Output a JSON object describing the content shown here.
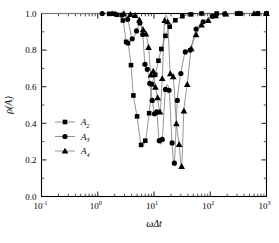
{
  "chart_data": {
    "type": "line",
    "title": "",
    "xlabel": "ωΔt",
    "ylabel": "ρ(A)",
    "xscale": "log",
    "yscale": "linear",
    "xlim": [
      0.1,
      1000
    ],
    "ylim": [
      0.0,
      1.0
    ],
    "grid": false,
    "legend_position": "center-left",
    "x_tick_labels": [
      "10-1",
      "100",
      "101",
      "102",
      "103"
    ],
    "x_tick_values": [
      0.1,
      1,
      10,
      100,
      1000
    ],
    "y_tick_labels": [
      "0.0",
      "0.2",
      "0.4",
      "0.6",
      "0.8",
      "1.0"
    ],
    "y_tick_values": [
      0.0,
      0.2,
      0.4,
      0.6,
      0.8,
      1.0
    ],
    "x_exponents": [
      "-1",
      "0",
      "1",
      "2",
      "3"
    ],
    "x_mantissa": "10",
    "series": [
      {
        "name": "A2",
        "label_base": "A",
        "label_sub": "2",
        "marker": "square",
        "points": [
          [
            0.1,
            1.0
          ],
          [
            0.3,
            1.0
          ],
          [
            0.6,
            1.0
          ],
          [
            1.0,
            1.0
          ],
          [
            1.6,
            0.998
          ],
          [
            2.2,
            0.993
          ],
          [
            2.8,
            0.962
          ],
          [
            3.2,
            0.845
          ],
          [
            3.45,
            0.838
          ],
          [
            3.9,
            0.718
          ],
          [
            4.3,
            0.552
          ],
          [
            5.0,
            0.438
          ],
          [
            5.9,
            0.282
          ],
          [
            7.0,
            0.305
          ],
          [
            8.2,
            0.455
          ],
          [
            9.2,
            0.613
          ],
          [
            10.5,
            0.665
          ],
          [
            12.0,
            0.742
          ],
          [
            13.5,
            0.806
          ],
          [
            16.0,
            0.878
          ],
          [
            19.0,
            0.928
          ],
          [
            24.0,
            0.963
          ],
          [
            32.0,
            0.985
          ],
          [
            45.0,
            0.995
          ],
          [
            70.0,
            1.0
          ],
          [
            130.0,
            1.0
          ],
          [
            300.0,
            1.0
          ],
          [
            700.0,
            1.0
          ],
          [
            1000.0,
            1.0
          ]
        ]
      },
      {
        "name": "A3",
        "label_base": "A",
        "label_sub": "3",
        "marker": "circle",
        "points": [
          [
            0.1,
            1.0
          ],
          [
            0.5,
            1.0
          ],
          [
            1.2,
            1.0
          ],
          [
            2.0,
            0.998
          ],
          [
            2.7,
            0.992
          ],
          [
            3.4,
            0.968
          ],
          [
            4.1,
            0.862
          ],
          [
            4.9,
            0.905
          ],
          [
            5.6,
            0.948
          ],
          [
            6.3,
            0.885
          ],
          [
            6.9,
            0.722
          ],
          [
            7.6,
            0.695
          ],
          [
            8.4,
            0.618
          ],
          [
            9.3,
            0.525
          ],
          [
            10.2,
            0.452
          ],
          [
            11.2,
            0.462
          ],
          [
            12.4,
            0.305
          ],
          [
            14.0,
            0.312
          ],
          [
            16.0,
            0.585
          ],
          [
            18.5,
            0.58
          ],
          [
            21.0,
            0.293
          ],
          [
            23.0,
            0.182
          ],
          [
            26.0,
            0.525
          ],
          [
            30.0,
            0.672
          ],
          [
            36.0,
            0.79
          ],
          [
            44.0,
            0.8
          ],
          [
            56.0,
            0.915
          ],
          [
            75.0,
            0.955
          ],
          [
            110.0,
            0.985
          ],
          [
            180.0,
            0.998
          ],
          [
            350.0,
            1.0
          ],
          [
            700.0,
            1.0
          ],
          [
            1000.0,
            1.0
          ]
        ]
      },
      {
        "name": "A4",
        "label_base": "A",
        "label_sub": "4",
        "marker": "triangle",
        "points": [
          [
            0.1,
            1.0
          ],
          [
            0.8,
            1.0
          ],
          [
            1.8,
            1.0
          ],
          [
            2.9,
            0.999
          ],
          [
            3.8,
            0.995
          ],
          [
            4.6,
            0.99
          ],
          [
            5.5,
            0.965
          ],
          [
            6.4,
            0.912
          ],
          [
            7.2,
            0.888
          ],
          [
            8.0,
            0.815
          ],
          [
            8.8,
            0.665
          ],
          [
            9.7,
            0.685
          ],
          [
            10.6,
            0.598
          ],
          [
            11.6,
            0.54
          ],
          [
            12.8,
            0.462
          ],
          [
            14.0,
            0.645
          ],
          [
            15.5,
            0.962
          ],
          [
            17.5,
            0.955
          ],
          [
            19.5,
            0.672
          ],
          [
            22.0,
            0.655
          ],
          [
            25.0,
            0.398
          ],
          [
            28.0,
            0.285
          ],
          [
            31.0,
            0.165
          ],
          [
            34.0,
            0.468
          ],
          [
            39.0,
            0.613
          ],
          [
            46.0,
            0.808
          ],
          [
            56.0,
            0.885
          ],
          [
            70.0,
            0.938
          ],
          [
            92.0,
            0.962
          ],
          [
            125.0,
            0.988
          ],
          [
            190.0,
            0.998
          ],
          [
            320.0,
            1.0
          ],
          [
            600.0,
            1.0
          ],
          [
            1000.0,
            1.0
          ]
        ]
      }
    ]
  },
  "legend": {
    "entries": [
      {
        "label_base": "A",
        "label_sub": "2",
        "marker": "square"
      },
      {
        "label_base": "A",
        "label_sub": "3",
        "marker": "circle"
      },
      {
        "label_base": "A",
        "label_sub": "4",
        "marker": "triangle"
      }
    ]
  },
  "colors": {
    "axis": "#000000",
    "curve": "#777777",
    "marker": "#000000",
    "background": "#ffffff"
  }
}
